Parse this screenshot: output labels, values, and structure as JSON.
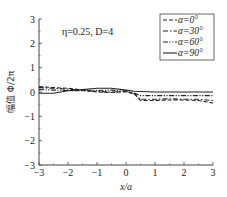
{
  "chart_data": {
    "type": "line",
    "title": "",
    "annotation": "η=0.25, D=4",
    "xlabel": "x/a",
    "ylabel": "幅值 Φ/2π",
    "xlim": [
      -3,
      3
    ],
    "ylim": [
      -3,
      3
    ],
    "xticks": [
      -3,
      -2,
      -1,
      0,
      1,
      2,
      3
    ],
    "yticks": [
      -3,
      -2,
      -1,
      0,
      1,
      2,
      3
    ],
    "xtick_labels": [
      "−3",
      "−2",
      "−1",
      "0",
      "1",
      "2",
      "3"
    ],
    "ytick_labels": [
      "−3",
      "−2",
      "−1",
      "0",
      "1",
      "2",
      "3"
    ],
    "grid": false,
    "legend_position": "upper right",
    "x": [
      -3,
      -2.5,
      -2,
      -1.5,
      -1,
      -0.5,
      0,
      0.3,
      0.5,
      1,
      1.5,
      2,
      2.5,
      3
    ],
    "series": [
      {
        "name": "α=0°",
        "style": "dashed",
        "values": [
          0.22,
          0.18,
          0.15,
          0.08,
          0.0,
          -0.02,
          0.02,
          -0.1,
          -0.35,
          -0.35,
          -0.33,
          -0.33,
          -0.35,
          -0.45
        ]
      },
      {
        "name": "α=30°",
        "style": "dashdot",
        "values": [
          0.18,
          0.15,
          0.12,
          0.06,
          0.02,
          0.0,
          0.02,
          -0.08,
          -0.3,
          -0.3,
          -0.28,
          -0.3,
          -0.3,
          -0.35
        ]
      },
      {
        "name": "α=60°",
        "style": "dashdotdot",
        "values": [
          0.1,
          0.08,
          0.06,
          0.05,
          0.06,
          0.08,
          0.04,
          -0.05,
          -0.15,
          -0.15,
          -0.15,
          -0.15,
          -0.15,
          -0.15
        ]
      },
      {
        "name": "α=90°",
        "style": "solid",
        "values": [
          -0.05,
          -0.05,
          0.05,
          0.1,
          0.15,
          0.15,
          0.08,
          0.03,
          0.02,
          0.0,
          0.0,
          0.0,
          0.0,
          0.0
        ]
      }
    ]
  },
  "legend": {
    "items": [
      "α=0°",
      "α=30°",
      "α=60°",
      "α=90°"
    ]
  },
  "labels": {
    "annotation": "η=0.25, D=4",
    "xlabel": "x/a",
    "ylabel": "幅值 Φ/2π"
  },
  "colors": {
    "line": "#222222",
    "axis": "#444444"
  }
}
